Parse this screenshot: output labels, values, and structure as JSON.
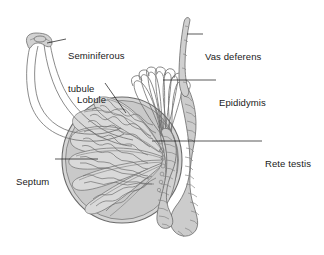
{
  "figure": {
    "type": "anatomical-line-drawing",
    "background_color": "#ffffff",
    "outline_color": "#6d6d6d",
    "fill_color": "#d2d2d2",
    "text_color": "#1a1a1a",
    "leader_color": "#111111",
    "width": 324,
    "height": 255
  },
  "labels": {
    "seminiferous_tubule": {
      "line1": "Seminiferous",
      "line2": "tubule"
    },
    "lobule": {
      "line1": "Lobule"
    },
    "vas_deferens": {
      "line1": "Vas deferens"
    },
    "epididymis": {
      "line1": "Epididymis"
    },
    "rete_testis": {
      "line1": "Rete testis"
    },
    "septum": {
      "line1": "Septum"
    }
  },
  "structures": [
    {
      "name": "testis",
      "description": "ovoid organ shown in sagittal section"
    },
    {
      "name": "seminiferous-tubule",
      "description": "single U-shaped convoluted tubule drawn unravelled at upper left"
    },
    {
      "name": "lobule",
      "description": "wedge-shaped compartment containing coiled seminiferous tubules"
    },
    {
      "name": "septum",
      "description": "fibrous partition dividing the testis into lobules"
    },
    {
      "name": "rete-testis",
      "description": "network of channels at the posterior testis"
    },
    {
      "name": "efferent-ductules",
      "description": "arcing ducts from rete testis to head of epididymis"
    },
    {
      "name": "epididymis",
      "description": "highly coiled duct along the posterior border"
    },
    {
      "name": "vas-deferens",
      "description": "smooth muscular duct ascending from the tail of the epididymis"
    }
  ]
}
